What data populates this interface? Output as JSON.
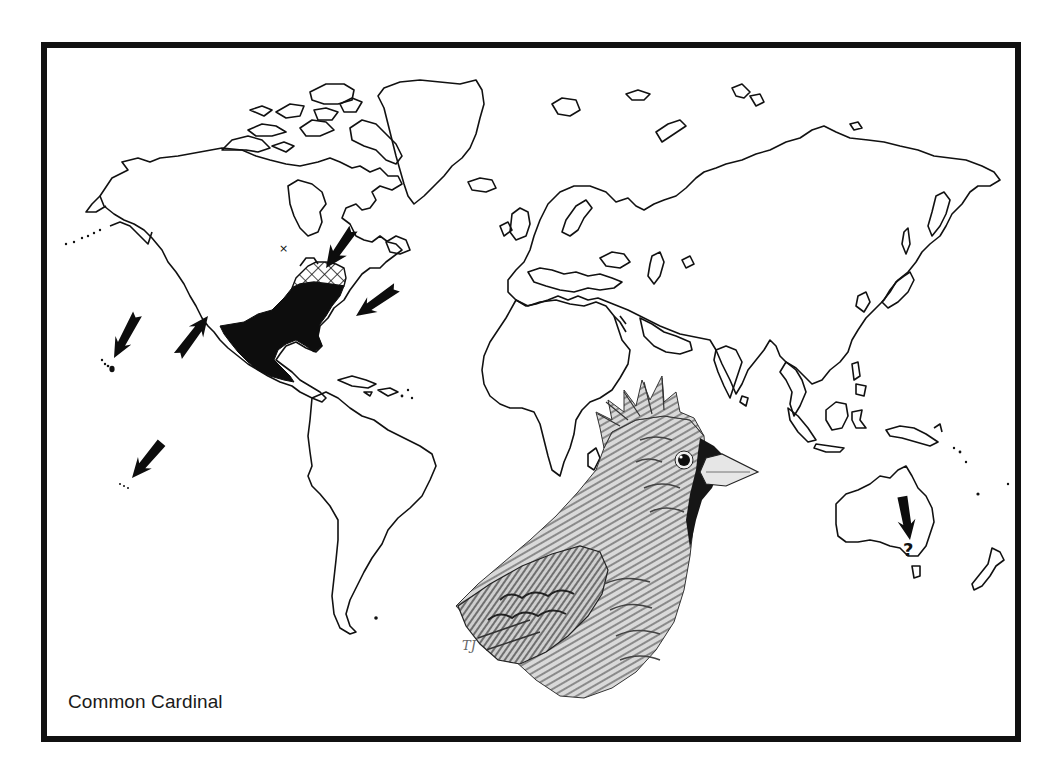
{
  "map": {
    "title": "Common Cardinal",
    "type": "species-range-map",
    "projection": "world",
    "colors": {
      "frame": "#111111",
      "land_outline": "#111111",
      "native_range": "#0d0d0d",
      "background": "#ffffff"
    },
    "legend": {
      "solid_fill": "native range",
      "cross_hatch": "northern range expansion",
      "arrows": "introduced / outlying populations"
    },
    "regions": [
      {
        "name": "North America",
        "range": "solid",
        "notes": "Eastern USA, Mexico, Central America"
      },
      {
        "name": "Southeastern Canada / Great Lakes",
        "range": "cross-hatched"
      },
      {
        "name": "Baja California",
        "marker": "arrow"
      },
      {
        "name": "Hawaii",
        "marker": "arrow"
      },
      {
        "name": "Bermuda",
        "marker": "arrow"
      },
      {
        "name": "Maritime Canada",
        "marker": "arrow"
      },
      {
        "name": "Central Pacific islands",
        "marker": "arrow"
      },
      {
        "name": "Southeastern Australia",
        "marker": "arrow",
        "annotation": "?"
      }
    ],
    "annotations": {
      "australia_question_mark": "?",
      "isolated_record_marker": "x"
    },
    "illustration": {
      "subject": "Cardinal head and shoulders, pen-and-ink",
      "signature": "TJ"
    }
  }
}
